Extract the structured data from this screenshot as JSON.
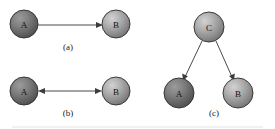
{
  "figure": {
    "width": 275,
    "height": 129,
    "background": "#ffffff"
  },
  "colors": {
    "node_fill_light": "#b4b4b4",
    "node_fill_mid": "#8c8c8c",
    "node_fill_dark": "#555555",
    "node_stroke": "#2c2c2c",
    "edge_stroke": "#4a4a4a",
    "arrow_fill": "#3d3d3d",
    "text": "#1a1a1a",
    "rule": "#e2e2e2"
  },
  "panels": [
    {
      "id": "a",
      "caption": "(a)",
      "caption_x": 68,
      "caption_y": 47,
      "nodes": [
        {
          "id": "a-node-a",
          "label": "A",
          "cx": 24,
          "cy": 24,
          "r": 14,
          "shade": "dark"
        },
        {
          "id": "a-node-b",
          "label": "B",
          "cx": 116,
          "cy": 24,
          "r": 14,
          "shade": "light"
        }
      ],
      "edges": [
        {
          "id": "a-edge-ab",
          "from": "A",
          "to": "B",
          "x1": 38,
          "y1": 26,
          "x2": 101,
          "y2": 26,
          "arrow_start": false,
          "arrow_end": true
        }
      ]
    },
    {
      "id": "b",
      "caption": "(b)",
      "caption_x": 68,
      "caption_y": 113,
      "nodes": [
        {
          "id": "b-node-a",
          "label": "A",
          "cx": 24,
          "cy": 91,
          "r": 14,
          "shade": "dark"
        },
        {
          "id": "b-node-b",
          "label": "B",
          "cx": 116,
          "cy": 91,
          "r": 14,
          "shade": "light"
        }
      ],
      "edges": [
        {
          "id": "b-edge-ab",
          "from": "A",
          "to": "B",
          "x1": 39,
          "y1": 91,
          "x2": 101,
          "y2": 91,
          "arrow_start": true,
          "arrow_end": true
        }
      ]
    },
    {
      "id": "c",
      "caption": "(c)",
      "caption_x": 214,
      "caption_y": 113,
      "nodes": [
        {
          "id": "c-node-c",
          "label": "C",
          "cx": 209,
          "cy": 27,
          "r": 15,
          "shade": "light"
        },
        {
          "id": "c-node-a",
          "label": "A",
          "cx": 179,
          "cy": 93,
          "r": 15,
          "shade": "dark"
        },
        {
          "id": "c-node-b",
          "label": "B",
          "cx": 238,
          "cy": 93,
          "r": 15,
          "shade": "light"
        }
      ],
      "edges": [
        {
          "id": "c-edge-ca",
          "from": "C",
          "to": "A",
          "x1": 203,
          "y1": 41,
          "x2": 184,
          "y2": 79,
          "arrow_start": false,
          "arrow_end": true
        },
        {
          "id": "c-edge-cb",
          "from": "C",
          "to": "B",
          "x1": 215,
          "y1": 41,
          "x2": 233,
          "y2": 79,
          "arrow_start": false,
          "arrow_end": true
        }
      ]
    }
  ],
  "footer_rule": {
    "x1": 12,
    "y1": 127,
    "x2": 263,
    "y2": 127
  }
}
